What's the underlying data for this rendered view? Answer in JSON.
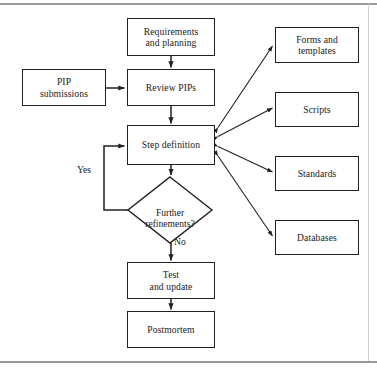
{
  "figure": {
    "type": "flowchart",
    "title": "",
    "frame": {
      "top_rule_color": "#9a9a9a",
      "bottom_rule_color": "#9a9a9a",
      "right_rule_color": "#c9c9c9"
    },
    "style": {
      "node_border_color": "#231f20",
      "node_fill": "#ffffff",
      "edge_color": "#231f20",
      "text_color": "#1a1a1a"
    }
  },
  "nodes": [
    {
      "id": "requirements",
      "shape": "rect",
      "label": "Requirements\nand planning",
      "x": 127,
      "y": 18,
      "w": 88,
      "h": 38
    },
    {
      "id": "pip_submissions",
      "shape": "rect",
      "label": "PIP\nsubmissions",
      "x": 22,
      "y": 69,
      "w": 84,
      "h": 37
    },
    {
      "id": "review_pips",
      "shape": "rect",
      "label": "Review PIPs",
      "x": 127,
      "y": 69,
      "w": 88,
      "h": 37
    },
    {
      "id": "step_definition",
      "shape": "rect",
      "label": "Step definition",
      "x": 127,
      "y": 125,
      "w": 88,
      "h": 40
    },
    {
      "id": "further_refinements",
      "shape": "diamond",
      "label": "Further\nrefinements?",
      "x": 128,
      "y": 177,
      "w": 84,
      "h": 66
    },
    {
      "id": "test_and_update",
      "shape": "rect",
      "label": "Test\nand update",
      "x": 127,
      "y": 262,
      "w": 88,
      "h": 37
    },
    {
      "id": "postmortem",
      "shape": "rect",
      "label": "Postmortem",
      "x": 127,
      "y": 311,
      "w": 88,
      "h": 37
    },
    {
      "id": "forms_templates",
      "shape": "rect",
      "label": "Forms and\ntemplates",
      "x": 275,
      "y": 27,
      "w": 84,
      "h": 36
    },
    {
      "id": "scripts",
      "shape": "rect",
      "label": "Scripts",
      "x": 275,
      "y": 92,
      "w": 84,
      "h": 35
    },
    {
      "id": "standards",
      "shape": "rect",
      "label": "Standards",
      "x": 275,
      "y": 156,
      "w": 84,
      "h": 35
    },
    {
      "id": "databases",
      "shape": "rect",
      "label": "Databases",
      "x": 275,
      "y": 220,
      "w": 84,
      "h": 35
    }
  ],
  "edge_labels": [
    {
      "id": "yes",
      "text": "Yes",
      "x": 77,
      "y": 164
    },
    {
      "id": "no",
      "text": "No",
      "x": 174,
      "y": 242
    }
  ],
  "edges": [
    {
      "from": "requirements",
      "to": "step_definition",
      "kind": "arrow"
    },
    {
      "from": "pip_submissions",
      "to": "review_pips",
      "kind": "arrow"
    },
    {
      "from": "review_pips",
      "to": "step_definition",
      "kind": "arrow"
    },
    {
      "from": "step_definition",
      "to": "further_refinements",
      "kind": "arrow"
    },
    {
      "from": "further_refinements",
      "to": "step_definition",
      "kind": "arrow",
      "label": "Yes"
    },
    {
      "from": "further_refinements",
      "to": "test_and_update",
      "kind": "arrow",
      "label": "No"
    },
    {
      "from": "test_and_update",
      "to": "postmortem",
      "kind": "arrow"
    },
    {
      "from": "step_definition",
      "to": "forms_templates",
      "kind": "double-arrow"
    },
    {
      "from": "step_definition",
      "to": "scripts",
      "kind": "double-arrow"
    },
    {
      "from": "step_definition",
      "to": "standards",
      "kind": "double-arrow"
    },
    {
      "from": "step_definition",
      "to": "databases",
      "kind": "double-arrow"
    }
  ]
}
